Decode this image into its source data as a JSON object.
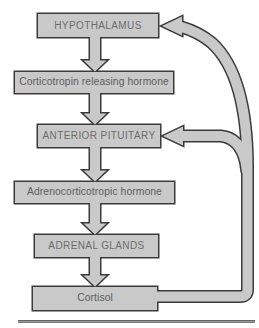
{
  "diagram": {
    "type": "flowchart-with-feedback",
    "boxes": [
      {
        "id": "hypothalamus",
        "label": "HYPOTHALAMUS"
      },
      {
        "id": "crh",
        "label": "Corticotropin releasing hormone"
      },
      {
        "id": "anterior-pituitary",
        "label": "ANTERIOR PITUITARY"
      },
      {
        "id": "acth",
        "label": "Adrenocorticotropic hormone"
      },
      {
        "id": "adrenal-glands",
        "label": "ADRENAL GLANDS"
      },
      {
        "id": "cortisol",
        "label": "Cortisol"
      }
    ],
    "flow_edges": [
      {
        "from": "HYPOTHALAMUS",
        "to": "Corticotropin releasing hormone"
      },
      {
        "from": "Corticotropin releasing hormone",
        "to": "ANTERIOR PITUITARY"
      },
      {
        "from": "ANTERIOR PITUITARY",
        "to": "Adrenocorticotropic hormone"
      },
      {
        "from": "Adrenocorticotropic hormone",
        "to": "ADRENAL GLANDS"
      },
      {
        "from": "ADRENAL GLANDS",
        "to": "Cortisol"
      }
    ],
    "feedback_edges": [
      {
        "from": "Cortisol",
        "to": "HYPOTHALAMUS",
        "type": "feedback"
      },
      {
        "from": "Cortisol",
        "to": "ANTERIOR PITUITARY",
        "type": "feedback"
      }
    ],
    "colors": {
      "background": "#ffffff",
      "box_fill": "#c9c9c9",
      "outline": "#3b3b3b",
      "uppercase_text": "#6d6d6d",
      "mixedcase_text": "#5d5d5d",
      "divider": "#6a6a6a"
    }
  }
}
